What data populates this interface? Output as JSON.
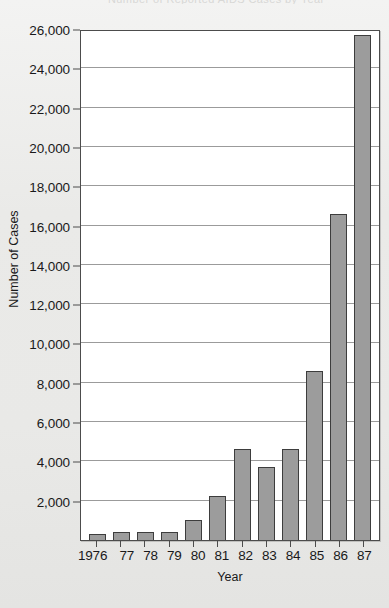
{
  "figure": {
    "title_remnant": "Number of Reported AIDS Cases by Year",
    "background_color": "#ececeb",
    "plot_background_color": "#ffffff",
    "bar_fill_color": "#9c9c9c",
    "bar_border_color": "#3d3d3d",
    "gridline_color": "#9b9b9b",
    "axis_color": "#4c4c4c"
  },
  "chart_data": {
    "type": "bar",
    "title": "",
    "xlabel": "Year",
    "ylabel": "Number of Cases",
    "categories": [
      "1976",
      "77",
      "78",
      "79",
      "80",
      "81",
      "82",
      "83",
      "84",
      "85",
      "86",
      "87"
    ],
    "values": [
      300,
      400,
      400,
      430,
      1000,
      2250,
      4650,
      3700,
      4650,
      8600,
      16600,
      25700
    ],
    "ylim": [
      0,
      26000
    ],
    "yticks": [
      2000,
      4000,
      6000,
      8000,
      10000,
      12000,
      14000,
      16000,
      18000,
      20000,
      22000,
      24000,
      26000
    ],
    "ytick_labels": [
      "2,000",
      "4,000",
      "6,000",
      "8,000",
      "10,000",
      "12,000",
      "14,000",
      "16,000",
      "18,000",
      "20,000",
      "22,000",
      "24,000",
      "26,000"
    ],
    "grid": true,
    "grid_axis": "y",
    "legend": false,
    "legend_position": "none",
    "series": [
      {
        "name": "Number of Cases",
        "values": [
          300,
          400,
          400,
          430,
          1000,
          2250,
          4650,
          3700,
          4650,
          8600,
          16600,
          25700
        ]
      }
    ],
    "annotations": []
  }
}
